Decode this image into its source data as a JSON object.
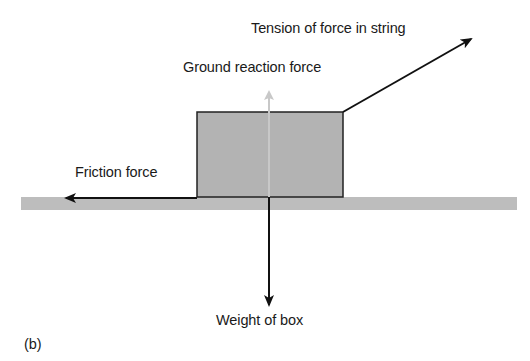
{
  "figure_label": "(b)",
  "labels": {
    "tension": "Tension of force in string",
    "ground_reaction": "Ground reaction force",
    "friction": "Friction force",
    "weight": "Weight of box"
  },
  "colors": {
    "box_fill": "#b3b3b3",
    "ground_fill": "#bdbdbd",
    "arrow": "#111111",
    "ground_reaction_arrow": "#c8c8c8"
  }
}
